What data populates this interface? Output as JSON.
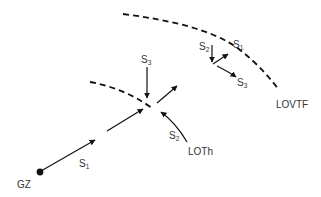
{
  "diagram": {
    "colors": {
      "line": "#111111",
      "text": "#333333",
      "background": "#ffffff"
    },
    "curves": [
      {
        "id": "lovtf",
        "label": "LOVTF",
        "style": "dashed"
      },
      {
        "id": "inner-front",
        "label": "",
        "style": "dashed"
      }
    ],
    "labels": {
      "gz": "GZ",
      "lovtf": "LOVTF",
      "loth": "LOTh",
      "s1_main": {
        "base": "S",
        "sub": "1"
      },
      "s2_main": {
        "base": "S",
        "sub": "2"
      },
      "s3_main": {
        "base": "S",
        "sub": "3"
      },
      "s1_upper": {
        "base": "S",
        "sub": "1"
      },
      "s2_upper": {
        "base": "S",
        "sub": "2"
      },
      "s3_upper": {
        "base": "S",
        "sub": "3"
      }
    },
    "nodes": [
      {
        "id": "gz",
        "label": "GZ",
        "shape": "filled-dot"
      }
    ]
  }
}
